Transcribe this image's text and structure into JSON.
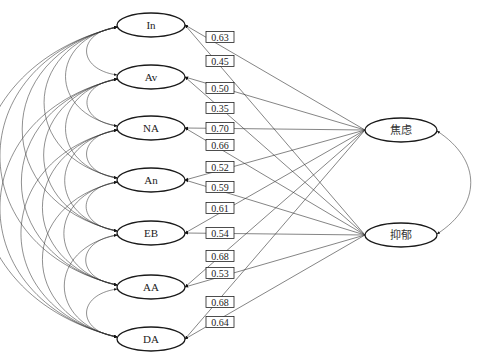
{
  "diagram": {
    "type": "structural-equation-path-diagram",
    "predictors": [
      {
        "id": "In",
        "label": "In",
        "cx": 151,
        "cy": 25
      },
      {
        "id": "Av",
        "label": "Av",
        "cx": 151,
        "cy": 77
      },
      {
        "id": "NA",
        "label": "NA",
        "cx": 151,
        "cy": 128
      },
      {
        "id": "An",
        "label": "An",
        "cx": 151,
        "cy": 180
      },
      {
        "id": "EB",
        "label": "EB",
        "cx": 151,
        "cy": 233
      },
      {
        "id": "AA",
        "label": "AA",
        "cx": 151,
        "cy": 287
      },
      {
        "id": "DA",
        "label": "DA",
        "cx": 151,
        "cy": 339
      }
    ],
    "outcomes": [
      {
        "id": "anxiety",
        "label": "焦虑",
        "cx": 401,
        "cy": 130
      },
      {
        "id": "depression",
        "label": "抑郁",
        "cx": 401,
        "cy": 235
      }
    ],
    "paths": [
      {
        "from": "anxiety",
        "to": "In",
        "coef": "0.63",
        "label_y": 37
      },
      {
        "from": "depression",
        "to": "In",
        "coef": "0.45",
        "label_y": 61
      },
      {
        "from": "anxiety",
        "to": "Av",
        "coef": "0.50",
        "label_y": 88
      },
      {
        "from": "depression",
        "to": "Av",
        "coef": "0.35",
        "label_y": 108
      },
      {
        "from": "anxiety",
        "to": "NA",
        "coef": "0.70",
        "label_y": 128
      },
      {
        "from": "depression",
        "to": "NA",
        "coef": "0.66",
        "label_y": 145
      },
      {
        "from": "anxiety",
        "to": "An",
        "coef": "0.52",
        "label_y": 167
      },
      {
        "from": "depression",
        "to": "An",
        "coef": "0.59",
        "label_y": 187
      },
      {
        "from": "anxiety",
        "to": "EB",
        "coef": "0.61",
        "label_y": 208
      },
      {
        "from": "depression",
        "to": "EB",
        "coef": "0.54",
        "label_y": 233
      },
      {
        "from": "anxiety",
        "to": "AA",
        "coef": "0.68",
        "label_y": 256
      },
      {
        "from": "depression",
        "to": "AA",
        "coef": "0.53",
        "label_y": 273
      },
      {
        "from": "anxiety",
        "to": "DA",
        "coef": "0.68",
        "label_y": 302
      },
      {
        "from": "depression",
        "to": "DA",
        "coef": "0.64",
        "label_y": 322
      }
    ],
    "covariances": {
      "predictors": "all pairs (curved double-headed arcs on left)",
      "outcomes": [
        "anxiety",
        "depression"
      ]
    },
    "colors": {
      "stroke": "#222222",
      "background": "#ffffff"
    }
  }
}
